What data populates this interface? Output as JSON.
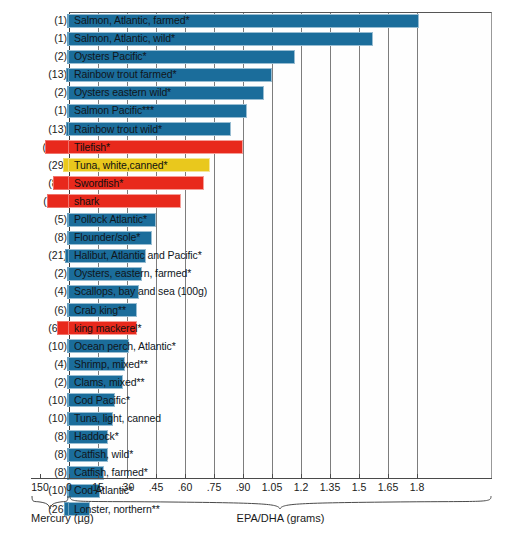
{
  "chart_data": {
    "type": "bar",
    "title": "",
    "subtitle": "",
    "orientation": "horizontal",
    "xlabel_left": "Mercury (µg)",
    "xlabel_right": "EPA/DHA (grams)",
    "ylabel": "",
    "grid": true,
    "legend": "none",
    "axes": {
      "right_axis": {
        "name": "EPA/DHA (grams)",
        "ticks": [
          "0",
          "15",
          ".30",
          ".45",
          ".60",
          ".75",
          ".90",
          "1.05",
          "1.2",
          "1.35",
          "1.5",
          "1.65",
          "1.8"
        ],
        "tick_values": [
          0,
          0.15,
          0.3,
          0.45,
          0.6,
          0.75,
          0.9,
          1.05,
          1.2,
          1.35,
          1.5,
          1.65,
          1.8
        ],
        "range": [
          0,
          1.8
        ]
      },
      "left_axis": {
        "name": "Mercury (µg)",
        "ticks": [
          "150",
          "0"
        ],
        "tick_values": [
          150,
          0
        ],
        "range": [
          0,
          150
        ]
      }
    },
    "colors": {
      "blue": "#1b6d9b",
      "red": "#e8291c",
      "yellow": "#e9c81d",
      "gridline": "#7d7d7d",
      "axis": "#4a4a4a",
      "background": "#ffffff"
    },
    "categories": [
      "Salmon, Atlantic, farmed*",
      "Salmon, Atlantic, wild*",
      "Oysters Pacific*",
      "Rainbow trout farmed*",
      "Oysters eastern wild*",
      "Salmon Pacific***",
      "Rainbow trout wild*",
      "Tilefish*",
      "Tuna, white,canned*",
      "Swordfish*",
      "shark",
      "Pollock Atlantic*",
      "Flounder/sole*",
      "Halibut, Atlantic and Pacific*",
      "Oysters, eastern, farmed*",
      "Scallops, bay and sea (100g)",
      "Crab king**",
      "king mackerel*",
      "Ocean perch, Atlantic*",
      "Shrimp, mixed**",
      "Clams, mixed**",
      "Cod Pacific*",
      "Tuna, light, canned",
      "Haddock*",
      "Catfish, wild*",
      "Catfish, farmed*",
      "Cod Atlantic*",
      "Lonster, northern**"
    ],
    "series": [
      {
        "name": "EPA/DHA (grams)",
        "unit": "grams",
        "values": [
          1.81,
          1.57,
          1.17,
          1.05,
          1.01,
          0.92,
          0.84,
          0.9,
          0.73,
          0.7,
          0.58,
          0.45,
          0.43,
          0.4,
          0.38,
          0.36,
          0.35,
          0.35,
          0.31,
          0.29,
          0.28,
          0.24,
          0.23,
          0.2,
          0.2,
          0.18,
          0.16,
          0.11
        ]
      },
      {
        "name": "Mercury (µg)",
        "unit": "µg",
        "values": [
          1,
          1,
          2,
          13,
          2,
          1,
          13,
          122,
          29,
          81,
          112,
          5,
          8,
          21,
          2,
          4,
          6,
          61,
          10,
          4,
          2,
          10,
          10,
          8,
          8,
          8,
          10,
          26
        ]
      }
    ],
    "bar_colors": [
      "blue",
      "blue",
      "blue",
      "blue",
      "blue",
      "blue",
      "blue",
      "red",
      "yellow",
      "red",
      "red",
      "blue",
      "blue",
      "blue",
      "blue",
      "blue",
      "blue",
      "red",
      "blue",
      "blue",
      "blue",
      "blue",
      "blue",
      "blue",
      "blue",
      "blue",
      "blue",
      "blue"
    ],
    "count_labels": [
      "(1)",
      "(1)",
      "(2)",
      "(13)",
      "(2)",
      "(1)",
      "(13)",
      "(122)",
      "(29)",
      "(81)",
      "(112)",
      "(5)",
      "(8)",
      "(21)",
      "(2)",
      "(4)",
      "(6)",
      "(61)",
      "(10)",
      "(4)",
      "(2)",
      "(10)",
      "(10)",
      "(8)",
      "(8)",
      "(8)",
      "(10)",
      "(26)"
    ]
  }
}
